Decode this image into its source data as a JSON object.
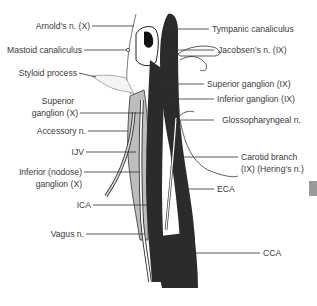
{
  "diagram": {
    "colors": {
      "artery": "#2a2a2a",
      "vein": "#b8b8b8",
      "nerve": "#ffffff",
      "outline": "#333333",
      "leader": "#333333",
      "edge_tab": "#9a9a9a"
    },
    "labels_left": [
      {
        "id": "arnolds",
        "text": "Arnold’s n. (X)"
      },
      {
        "id": "mastoid",
        "text": "Mastoid canaliculus"
      },
      {
        "id": "styloid",
        "text": "Styloid process"
      },
      {
        "id": "sup_ganglion_x_1",
        "text": "Superior"
      },
      {
        "id": "sup_ganglion_x_2",
        "text": "ganglion (X)"
      },
      {
        "id": "accessory",
        "text": "Accessory n."
      },
      {
        "id": "ijv",
        "text": "IJV"
      },
      {
        "id": "inf_ganglion_x_1",
        "text": "Inferior (nodose)"
      },
      {
        "id": "inf_ganglion_x_2",
        "text": "ganglion (X)"
      },
      {
        "id": "ica",
        "text": "ICA"
      },
      {
        "id": "vagus",
        "text": "Vagus n."
      }
    ],
    "labels_right": [
      {
        "id": "tympanic",
        "text": "Tympanic canaliculus"
      },
      {
        "id": "jacobsens",
        "text": "Jacobsen’s n. (IX)"
      },
      {
        "id": "sup_ganglion_ix",
        "text": "Superior ganglion (IX)"
      },
      {
        "id": "inf_ganglion_ix",
        "text": "Inferior ganglion (IX)"
      },
      {
        "id": "glossopharyngeal",
        "text": "Glossopharyngeal n."
      },
      {
        "id": "carotid_branch_1",
        "text": "Carotid branch"
      },
      {
        "id": "carotid_branch_2",
        "text": "(IX) (Hering’s n.)"
      },
      {
        "id": "eca",
        "text": "ECA"
      },
      {
        "id": "cca",
        "text": "CCA"
      }
    ]
  }
}
